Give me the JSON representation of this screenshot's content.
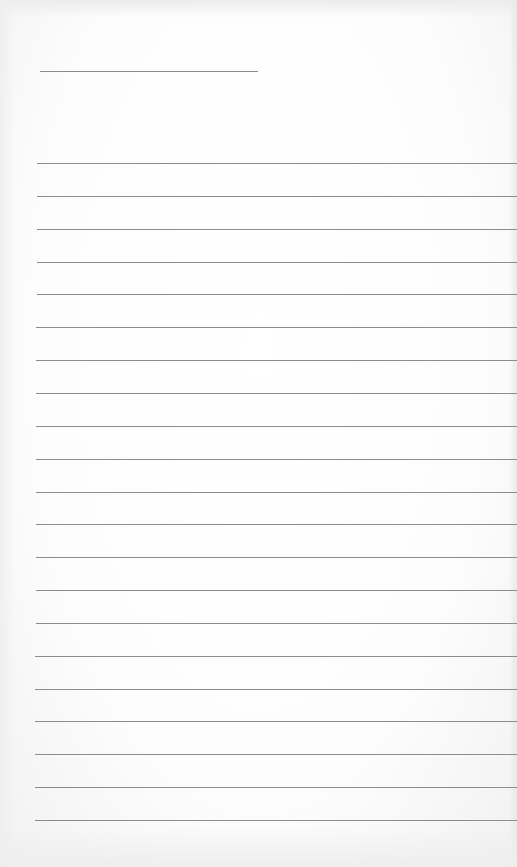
{
  "document": {
    "type": "lined-paper",
    "title_line": {
      "text": ""
    },
    "ruled_lines": [
      {
        "text": ""
      },
      {
        "text": ""
      },
      {
        "text": ""
      },
      {
        "text": ""
      },
      {
        "text": ""
      },
      {
        "text": ""
      },
      {
        "text": ""
      },
      {
        "text": ""
      },
      {
        "text": ""
      },
      {
        "text": ""
      },
      {
        "text": ""
      },
      {
        "text": ""
      },
      {
        "text": ""
      },
      {
        "text": ""
      },
      {
        "text": ""
      },
      {
        "text": ""
      },
      {
        "text": ""
      },
      {
        "text": ""
      },
      {
        "text": ""
      },
      {
        "text": ""
      },
      {
        "text": ""
      }
    ],
    "line_color": "#8c8c8c",
    "paper_color": "#ffffff"
  }
}
